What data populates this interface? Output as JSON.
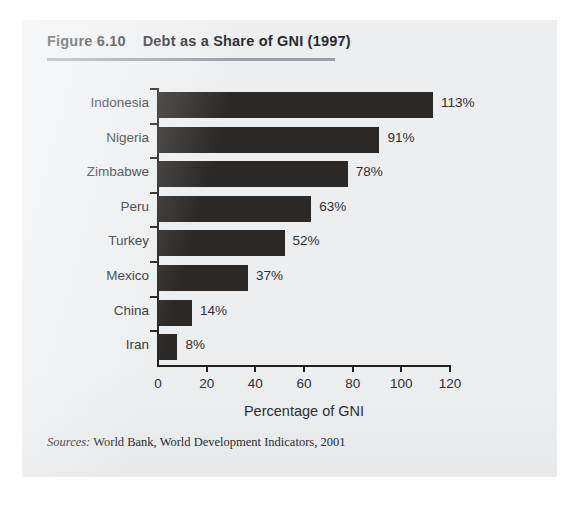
{
  "figure": {
    "number_label": "Figure 6.10",
    "title": "Debt as a Share of GNI (1997)",
    "title_full": "Figure 6.10    Debt as a Share of GNI (1997)",
    "source_label": "Sources:",
    "source_text": " World Bank, World Development Indicators, 2001",
    "background_color": "#eceef0",
    "bar_color": "#2b2825",
    "axis_color": "#22201e",
    "rule_color": "#9aa0a6"
  },
  "chart_data": {
    "type": "bar",
    "orientation": "horizontal",
    "title": "Debt as a Share of GNI (1997)",
    "xlabel": "Percentage of GNI",
    "ylabel": "",
    "categories": [
      "Indonesia",
      "Nigeria",
      "Zimbabwe",
      "Peru",
      "Turkey",
      "Mexico",
      "China",
      "Iran"
    ],
    "values": [
      113,
      91,
      78,
      63,
      52,
      37,
      14,
      8
    ],
    "value_labels": [
      "113%",
      "91%",
      "78%",
      "63%",
      "52%",
      "37%",
      "14%",
      "8%"
    ],
    "xlim": [
      0,
      120
    ],
    "xticks": [
      0,
      20,
      40,
      60,
      80,
      100,
      120
    ],
    "xtick_labels": [
      "0",
      "20",
      "40",
      "60",
      "80",
      "100",
      "120"
    ],
    "grid": false,
    "legend": null,
    "series": [
      {
        "name": "Debt as a Share of GNI (1997)",
        "values": [
          113,
          91,
          78,
          63,
          52,
          37,
          14,
          8
        ]
      }
    ]
  }
}
